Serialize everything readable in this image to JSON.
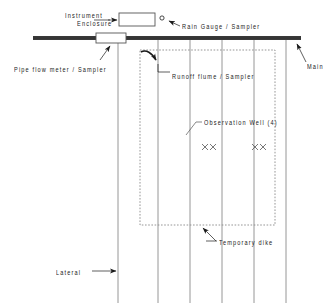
{
  "diagram": {
    "colors": {
      "ink": "#1a1a1a",
      "line": "#555555",
      "lateral": "#8a8a8a",
      "dike": "#8a8a8a",
      "road_fill": "#3a3a3a",
      "background": "#ffffff"
    },
    "labels": {
      "instrument_enclosure_line1": "Instrument",
      "instrument_enclosure_line2": "Enclosure",
      "rain_gauge": "Rain Gauge / Sampler",
      "pipe_flow_meter": "Pipe flow meter / Sampler",
      "runoff_flume": "Runoff flume / Sampler",
      "main_line": "Main",
      "observation_well": "Observation Well  (4)",
      "temporary_dike": "Temporary dike",
      "lateral": "Lateral"
    },
    "elements": {
      "main_line": {
        "x1": 33,
        "x2": 301,
        "y": 38,
        "thickness": 3
      },
      "instrument_box": {
        "x": 119,
        "y": 13,
        "width": 36,
        "height": 13
      },
      "pipe_meter_box": {
        "x": 96,
        "y": 34,
        "width": 30,
        "height": 10
      },
      "rain_gauge_marker": {
        "cx": 162,
        "cy": 18,
        "r": 2
      },
      "dike_rect": {
        "x": 140,
        "y": 50,
        "width": 135,
        "height": 175
      },
      "laterals": [
        118,
        158,
        190,
        222,
        254,
        286
      ],
      "lateral_top": 40,
      "lateral_bottom": 303,
      "observation_wells": [
        {
          "x": 205,
          "y": 147
        },
        {
          "x": 213,
          "y": 147
        },
        {
          "x": 255,
          "y": 147
        },
        {
          "x": 263,
          "y": 147
        }
      ]
    }
  }
}
